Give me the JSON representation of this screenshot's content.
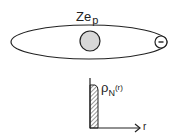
{
  "diagram": {
    "label_charge": "Ze",
    "label_charge_sub": "p",
    "electron_symbol": "-",
    "density_symbol": "ρ",
    "density_sub": "N",
    "density_arg": "(r)",
    "axis_label_x": "r",
    "colors": {
      "stroke": "#222222",
      "nucleus_fill": "#d8d8d8",
      "background": "#ffffff"
    }
  }
}
